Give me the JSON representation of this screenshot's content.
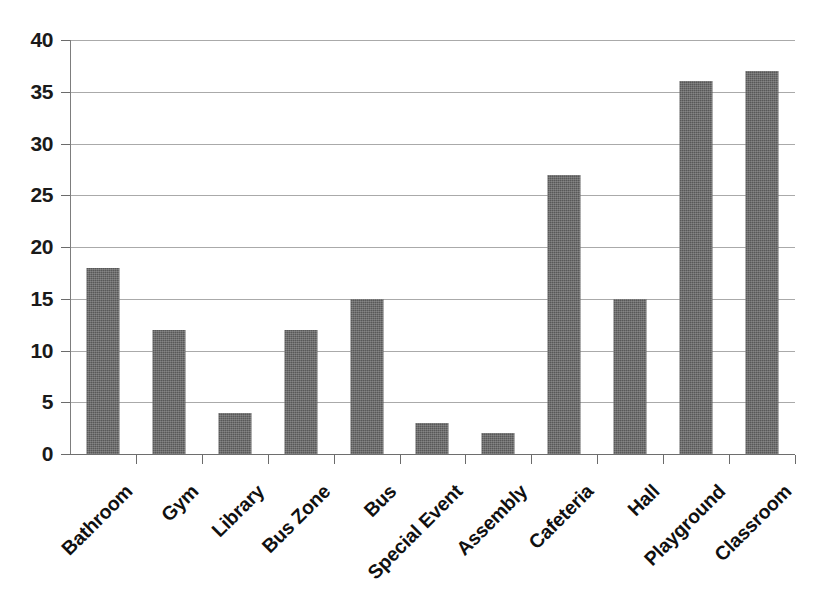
{
  "chart_data": {
    "type": "bar",
    "title": "",
    "subtitle": "",
    "xlabel": "",
    "ylabel": "",
    "categories": [
      "Bathroom",
      "Gym",
      "Library",
      "Bus Zone",
      "Bus",
      "Special Event",
      "Assembly",
      "Cafeteria",
      "Hall",
      "Playground",
      "Classroom"
    ],
    "values": [
      18,
      12,
      4,
      12,
      15,
      3,
      2,
      27,
      15,
      36,
      37
    ],
    "ylim": [
      0,
      40
    ],
    "ytick_step": 5,
    "yticks": [
      "0",
      "5",
      "10",
      "15",
      "20",
      "25",
      "30",
      "35",
      "40"
    ],
    "grid": true,
    "grid_axis": "y",
    "legend": false,
    "legend_position": "none",
    "bar_color": "#585858",
    "gridline_color": "#9b9b9b",
    "axis_color": "#6e6e6e",
    "label_color": "#101010",
    "label_rotation": -45
  }
}
